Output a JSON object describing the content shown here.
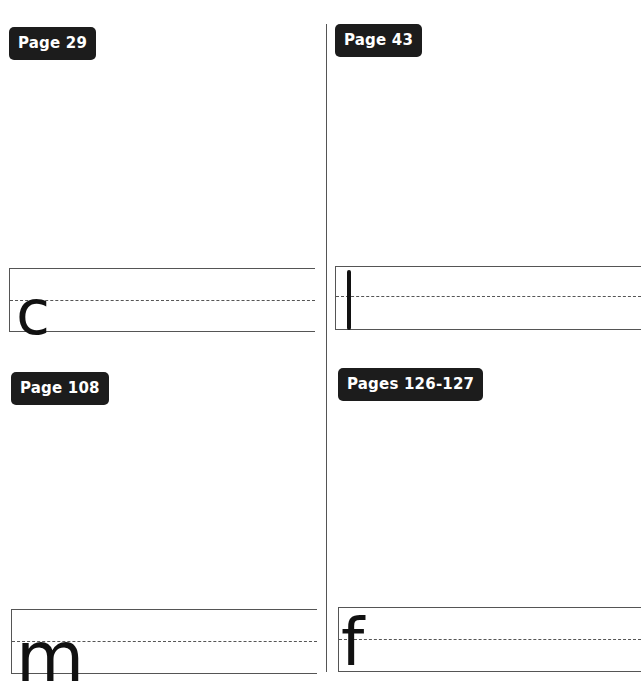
{
  "panels": [
    {
      "label": "Page 29",
      "letter": "c"
    },
    {
      "label": "Page 43",
      "letter": "l"
    },
    {
      "label": "Page 108",
      "letter": "m"
    },
    {
      "label": "Pages 126-127",
      "letter": "f"
    }
  ]
}
